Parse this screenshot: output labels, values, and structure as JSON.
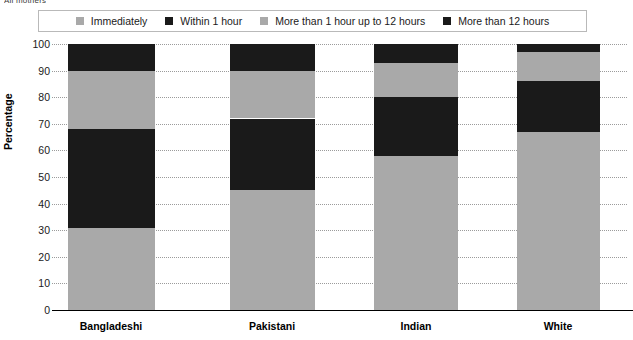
{
  "top_caption": "All mothers",
  "legend": {
    "items": [
      {
        "label": "Immediately",
        "color": "#a9a9a9",
        "name": "immediately"
      },
      {
        "label": "Within 1 hour",
        "color": "#1a1a1a",
        "name": "within-1-hour"
      },
      {
        "label": "More than 1 hour up to 12 hours",
        "color": "#a9a9a9",
        "name": "more-than-1-hour-up-to-12-hours"
      },
      {
        "label": "More than 12 hours",
        "color": "#1a1a1a",
        "name": "more-than-12-hours"
      }
    ]
  },
  "axes": {
    "ylabel": "Percentage",
    "yticks": [
      "0",
      "10",
      "20",
      "30",
      "40",
      "50",
      "60",
      "70",
      "80",
      "90",
      "100"
    ],
    "xlabels": [
      "Bangladeshi",
      "Pakistani",
      "Indian",
      "White"
    ]
  },
  "chart_data": {
    "type": "bar",
    "title": "All mothers",
    "xlabel": "",
    "ylabel": "Percentage",
    "ylim": [
      0,
      100
    ],
    "ytick_step": 10,
    "grid": true,
    "stacked": true,
    "legend_position": "top",
    "categories": [
      "Bangladeshi",
      "Pakistani",
      "Indian",
      "White"
    ],
    "series": [
      {
        "name": "Immediately",
        "color": "#a9a9a9",
        "values": [
          31,
          45,
          58,
          67
        ]
      },
      {
        "name": "Within 1 hour",
        "color": "#1a1a1a",
        "values": [
          37,
          27,
          22,
          19
        ]
      },
      {
        "name": "More than 1 hour up to 12 hours",
        "color": "#a9a9a9",
        "values": [
          22,
          18,
          13,
          11
        ]
      },
      {
        "name": "More than 12 hours",
        "color": "#1a1a1a",
        "values": [
          10,
          10,
          7,
          3
        ]
      }
    ]
  },
  "layout": {
    "plot_top_px": 44,
    "plot_bottom_px": 310,
    "bar_centers_px": [
      111,
      272,
      416,
      558
    ],
    "bar_widths_px": [
      87,
      85,
      84,
      83
    ]
  }
}
